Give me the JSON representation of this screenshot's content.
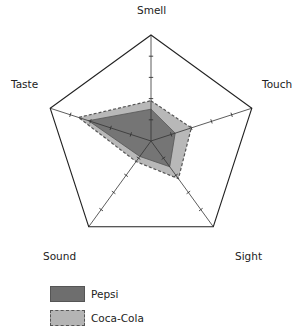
{
  "chart_data": {
    "type": "radar",
    "title": "",
    "axes": [
      "Smell",
      "Touch",
      "Sight",
      "Sound",
      "Taste"
    ],
    "scale": {
      "min": 0,
      "max": 5,
      "ticks": [
        1,
        2,
        3,
        4,
        5
      ]
    },
    "series": [
      {
        "name": "Pepsi",
        "values": [
          1.5,
          1.2,
          1.5,
          0.9,
          3.1
        ],
        "fill": "#6e6e6e",
        "stroke": "#555555",
        "dashed": false
      },
      {
        "name": "Coca-Cola",
        "values": [
          1.9,
          2.0,
          2.2,
          1.2,
          3.6
        ],
        "fill": "#b4b4b4",
        "stroke": "#555555",
        "dashed": true
      }
    ],
    "legend_position": "bottom-left",
    "grid": "outer pentagon only"
  },
  "labels": {
    "smell": "Smell",
    "touch": "Touch",
    "sight": "Sight",
    "sound": "Sound",
    "taste": "Taste"
  },
  "legend": {
    "items": [
      {
        "label": "Pepsi"
      },
      {
        "label": "Coca-Cola"
      }
    ]
  }
}
